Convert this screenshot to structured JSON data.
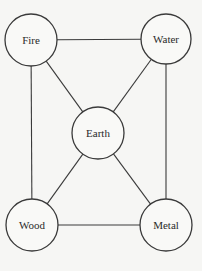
{
  "diagram": {
    "title": "",
    "type": "graph",
    "colors": {
      "background": "#f6f6f4",
      "stroke": "#3a3a3a",
      "text": "#2a2a2a"
    },
    "nodes": [
      {
        "id": "fire",
        "label": "Fire",
        "cx": 31,
        "cy": 40,
        "r": 26
      },
      {
        "id": "water",
        "label": "Water",
        "cx": 166,
        "cy": 39,
        "r": 25
      },
      {
        "id": "earth",
        "label": "Earth",
        "cx": 98,
        "cy": 133,
        "r": 26
      },
      {
        "id": "wood",
        "label": "Wood",
        "cx": 32,
        "cy": 225,
        "r": 26
      },
      {
        "id": "metal",
        "label": "Metal",
        "cx": 166,
        "cy": 225,
        "r": 26
      }
    ],
    "edges": [
      {
        "from": "fire",
        "to": "water"
      },
      {
        "from": "fire",
        "to": "wood"
      },
      {
        "from": "fire",
        "to": "earth"
      },
      {
        "from": "water",
        "to": "metal"
      },
      {
        "from": "water",
        "to": "earth"
      },
      {
        "from": "wood",
        "to": "metal"
      },
      {
        "from": "wood",
        "to": "earth"
      },
      {
        "from": "metal",
        "to": "earth"
      }
    ]
  }
}
